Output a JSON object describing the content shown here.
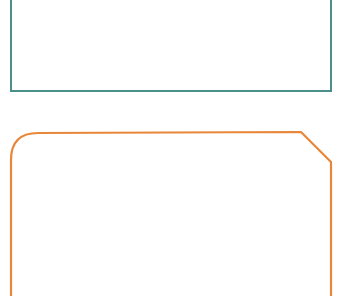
{
  "shapes": [
    {
      "name": "teal-rectangle",
      "stroke": "#4a8f8c",
      "type": "rectangle"
    },
    {
      "name": "orange-panel",
      "stroke": "#e8873a",
      "type": "rounded-chamfered-rectangle"
    }
  ]
}
